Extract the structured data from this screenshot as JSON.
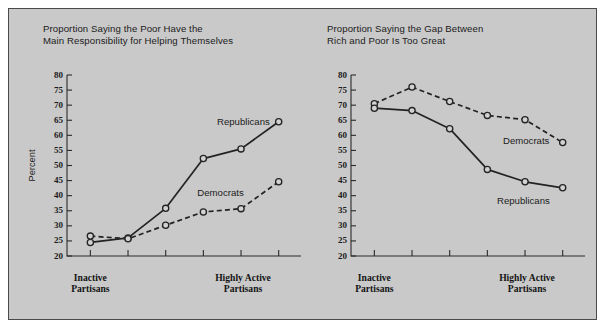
{
  "figure": {
    "background_color": "#c9c9c9",
    "border_color": "#4a4a4a"
  },
  "axis": {
    "ylabel": "Percent",
    "ticks": [
      "80",
      "75",
      "70",
      "65",
      "60",
      "55",
      "50",
      "45",
      "40",
      "35",
      "30",
      "25",
      "20"
    ],
    "category_left": "Inactive\nPartisans",
    "category_right": "Highly Active\nPartisans"
  },
  "chart_data": [
    {
      "type": "line",
      "title": "Proportion Saying the Poor Have the\nMain Responsibility for Helping Themselves",
      "xlabel": "",
      "ylabel": "Percent",
      "ylim": [
        20,
        80
      ],
      "ytick_step": 5,
      "grid": false,
      "legend": "inline-annotations",
      "categories": [
        "1",
        "2",
        "3",
        "4",
        "5",
        "6"
      ],
      "category_labels": [
        "Inactive Partisans",
        "",
        "",
        "",
        "",
        "Highly Active Partisans"
      ],
      "series": [
        {
          "name": "Republicans",
          "style": "solid",
          "marker": "open-circle",
          "values": [
            24.5,
            26.0,
            35.8,
            52.3,
            55.5,
            64.5
          ]
        },
        {
          "name": "Democrats",
          "style": "dashed",
          "marker": "open-circle",
          "values": [
            26.6,
            25.7,
            30.2,
            34.6,
            35.7,
            44.6
          ]
        }
      ]
    },
    {
      "type": "line",
      "title": "Proportion Saying the Gap Between\nRich and Poor Is Too Great",
      "xlabel": "",
      "ylabel": "",
      "ylim": [
        20,
        80
      ],
      "ytick_step": 5,
      "grid": false,
      "legend": "inline-annotations",
      "categories": [
        "1",
        "2",
        "3",
        "4",
        "5",
        "6"
      ],
      "category_labels": [
        "Inactive Partisans",
        "",
        "",
        "",
        "",
        "Highly Active Partisans"
      ],
      "series": [
        {
          "name": "Democrats",
          "style": "dashed",
          "marker": "open-circle",
          "values": [
            70.5,
            76.0,
            71.2,
            66.6,
            65.2,
            57.6
          ]
        },
        {
          "name": "Republicans",
          "style": "solid",
          "marker": "open-circle",
          "values": [
            69.0,
            68.2,
            62.2,
            48.7,
            44.6,
            42.6
          ]
        }
      ]
    }
  ]
}
